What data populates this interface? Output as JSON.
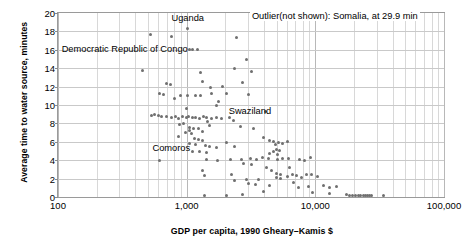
{
  "chart_data": {
    "type": "scatter",
    "title": "",
    "xlabel": "GDP per capita, 1990 Gheary–Kamis $",
    "ylabel": "Average time to water source, minutes",
    "xscale": "log",
    "xlim": [
      100,
      100000
    ],
    "ylim": [
      0,
      20
    ],
    "grid": true,
    "legend": null,
    "xticks": [
      "100",
      "1,000",
      "10,000",
      "100,000"
    ],
    "xtick_values": [
      100,
      1000,
      10000,
      100000
    ],
    "yticks": [
      "0",
      "2",
      "4",
      "6",
      "8",
      "10",
      "12",
      "14",
      "16",
      "18",
      "20"
    ],
    "ytick_values": [
      0,
      2,
      4,
      6,
      8,
      10,
      12,
      14,
      16,
      18,
      20
    ],
    "annotations": [
      {
        "name": "outlier-note",
        "text": "Outlier(not shown): Somalia, at 29.9 min",
        "x": 3100,
        "y": 19.6
      },
      {
        "name": "uganda-label",
        "text": "Uganda",
        "x": 1020,
        "y": 19.4
      },
      {
        "name": "drc-label",
        "text": "Democratic Republic of Congo",
        "x": 330,
        "y": 16.0
      },
      {
        "name": "swaziland-label",
        "text": "Swaziland",
        "x": 3100,
        "y": 9.2
      },
      {
        "name": "comoros-label",
        "text": "Comoros",
        "x": 760,
        "y": 5.2
      }
    ],
    "points": [
      [
        520,
        17.7
      ],
      [
        760,
        17.5
      ],
      [
        1020,
        18.3
      ],
      [
        2450,
        17.3
      ],
      [
        2900,
        15.0
      ],
      [
        1060,
        16.0
      ],
      [
        1120,
        16.0
      ],
      [
        1210,
        16.0
      ],
      [
        3200,
        13.6
      ],
      [
        2350,
        14.0
      ],
      [
        450,
        13.8
      ],
      [
        1270,
        13.5
      ],
      [
        1330,
        12.6
      ],
      [
        700,
        12.3
      ],
      [
        2700,
        12.4
      ],
      [
        750,
        12.2
      ],
      [
        1900,
        12.0
      ],
      [
        1520,
        11.9
      ],
      [
        620,
        11.2
      ],
      [
        660,
        11.1
      ],
      [
        900,
        11.0
      ],
      [
        1020,
        11.0
      ],
      [
        1180,
        11.0
      ],
      [
        1290,
        11.0
      ],
      [
        1560,
        11.3
      ],
      [
        2050,
        11.2
      ],
      [
        3050,
        11.1
      ],
      [
        1780,
        10.4
      ],
      [
        800,
        10.7
      ],
      [
        1700,
        10.0
      ],
      [
        560,
        9.0
      ],
      [
        600,
        8.9
      ],
      [
        640,
        8.8
      ],
      [
        700,
        8.8
      ],
      [
        760,
        8.6
      ],
      [
        820,
        8.7
      ],
      [
        870,
        8.5
      ],
      [
        930,
        8.8
      ],
      [
        990,
        8.6
      ],
      [
        1040,
        8.7
      ],
      [
        1110,
        8.6
      ],
      [
        1180,
        8.6
      ],
      [
        1260,
        8.5
      ],
      [
        1340,
        8.7
      ],
      [
        1420,
        8.6
      ],
      [
        1560,
        8.5
      ],
      [
        1700,
        8.6
      ],
      [
        1860,
        8.5
      ],
      [
        2150,
        8.6
      ],
      [
        2320,
        8.3
      ],
      [
        530,
        8.9
      ],
      [
        1440,
        8.2
      ],
      [
        950,
        8.0
      ],
      [
        880,
        7.9
      ],
      [
        1000,
        9.6
      ],
      [
        1500,
        7.8
      ],
      [
        2600,
        7.7
      ],
      [
        1060,
        7.6
      ],
      [
        1140,
        7.5
      ],
      [
        1230,
        7.4
      ],
      [
        1060,
        7.2
      ],
      [
        1320,
        7.1
      ],
      [
        980,
        7.0
      ],
      [
        1100,
        6.9
      ],
      [
        4100,
        9.3
      ],
      [
        3300,
        7.5
      ],
      [
        3950,
        6.5
      ],
      [
        4400,
        6.1
      ],
      [
        4700,
        6.0
      ],
      [
        4900,
        5.7
      ],
      [
        5200,
        5.9
      ],
      [
        5600,
        5.8
      ],
      [
        6100,
        6.0
      ],
      [
        5000,
        5.2
      ],
      [
        5300,
        5.1
      ],
      [
        4700,
        4.9
      ],
      [
        4400,
        4.7
      ],
      [
        5100,
        4.6
      ],
      [
        860,
        6.6
      ],
      [
        1150,
        6.4
      ],
      [
        1230,
        6.2
      ],
      [
        1320,
        6.1
      ],
      [
        1050,
        5.8
      ],
      [
        1180,
        5.7
      ],
      [
        1390,
        5.6
      ],
      [
        1500,
        5.5
      ],
      [
        1700,
        5.4
      ],
      [
        2050,
        5.9
      ],
      [
        2350,
        5.5
      ],
      [
        1120,
        5.0
      ],
      [
        1250,
        4.9
      ],
      [
        1430,
        4.8
      ],
      [
        610,
        4.0
      ],
      [
        1430,
        4.1
      ],
      [
        1740,
        4.0
      ],
      [
        2200,
        4.1
      ],
      [
        2650,
        4.1
      ],
      [
        3150,
        4.2
      ],
      [
        3500,
        4.1
      ],
      [
        3900,
        4.3
      ],
      [
        4300,
        4.2
      ],
      [
        5100,
        4.1
      ],
      [
        5600,
        4.2
      ],
      [
        6200,
        4.2
      ],
      [
        2750,
        3.6
      ],
      [
        3200,
        3.5
      ],
      [
        7600,
        4.1
      ],
      [
        8200,
        4.0
      ],
      [
        9200,
        4.3
      ],
      [
        1320,
        2.9
      ],
      [
        1380,
        2.3
      ],
      [
        4200,
        3.2
      ],
      [
        4600,
        2.9
      ],
      [
        5000,
        2.6
      ],
      [
        5400,
        2.5
      ],
      [
        5000,
        2.1
      ],
      [
        5400,
        2.0
      ],
      [
        6100,
        2.2
      ],
      [
        6600,
        2.4
      ],
      [
        7200,
        2.3
      ],
      [
        7800,
        2.1
      ],
      [
        8600,
        2.5
      ],
      [
        9400,
        2.4
      ],
      [
        10400,
        2.2
      ],
      [
        4400,
        1.2
      ],
      [
        7400,
        1.0
      ],
      [
        8900,
        1.1
      ],
      [
        11500,
        1.3
      ],
      [
        12800,
        1.0
      ],
      [
        14500,
        1.1
      ],
      [
        3950,
        0.6
      ],
      [
        9500,
        0.5
      ],
      [
        13000,
        0.4
      ],
      [
        17500,
        0.25
      ],
      [
        18500,
        0.2
      ],
      [
        19500,
        0.2
      ],
      [
        20500,
        0.2
      ],
      [
        21500,
        0.2
      ],
      [
        22500,
        0.2
      ],
      [
        23500,
        0.2
      ],
      [
        24500,
        0.2
      ],
      [
        25500,
        0.2
      ],
      [
        26500,
        0.2
      ],
      [
        27500,
        0.2
      ],
      [
        34000,
        0.2
      ],
      [
        1380,
        0.2
      ],
      [
        2050,
        0.2
      ],
      [
        2700,
        0.3
      ],
      [
        2350,
        1.8
      ],
      [
        2900,
        1.9
      ],
      [
        3050,
        1.5
      ],
      [
        3400,
        1.4
      ],
      [
        3600,
        1.9
      ],
      [
        2250,
        2.4
      ],
      [
        6800,
        1.6
      ],
      [
        6300,
        3.2
      ]
    ]
  }
}
